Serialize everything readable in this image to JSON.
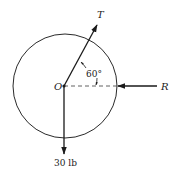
{
  "diagram": {
    "type": "free-body force diagram",
    "circle": {
      "cx": 65,
      "cy": 86,
      "r": 52,
      "stroke": "#2a2a2a"
    },
    "origin": {
      "label": "O",
      "x": 64,
      "y": 86
    },
    "forces": [
      {
        "id": "T",
        "label": "T",
        "direction_deg_from_horizontal": 60,
        "description": "tension at 60° above the horizontal"
      },
      {
        "id": "R",
        "label": "R",
        "direction": "pointing left toward circle edge",
        "description": "horizontal reaction"
      },
      {
        "id": "W",
        "label": "30 lb",
        "direction": "pointing straight down",
        "description": "weight"
      }
    ],
    "angle": {
      "label": "60°",
      "between": [
        "T",
        "horizontal reference (dashed)"
      ]
    },
    "reference_line": {
      "style": "dashed",
      "from": "O",
      "to": "right edge of circle"
    }
  }
}
